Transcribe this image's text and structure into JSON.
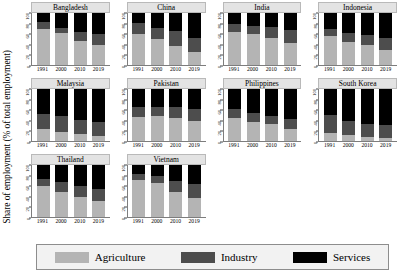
{
  "chart_data": {
    "type": "bar",
    "title": "",
    "subtype": "stacked-bar-small-multiples",
    "xlabel": "",
    "ylabel": "Share of employment (% of total employment)",
    "ylim": [
      0,
      100
    ],
    "yticks": [
      0,
      20,
      40,
      60,
      80,
      100
    ],
    "ytick_labels": [
      "0",
      "20",
      "40",
      "60",
      "80",
      "100"
    ],
    "categories": [
      "1991",
      "2000",
      "2010",
      "2019"
    ],
    "grid": false,
    "legend_position": "bottom",
    "series": [
      {
        "name": "Agriculture",
        "color": "#b4b4b4"
      },
      {
        "name": "Industry",
        "color": "#4d4d4d"
      },
      {
        "name": "Services",
        "color": "#000000"
      }
    ],
    "panels": [
      {
        "name": "Bangladesh",
        "values": {
          "Agriculture": [
            69,
            62,
            47,
            38
          ],
          "Industry": [
            13,
            10,
            17,
            21
          ],
          "Services": [
            18,
            28,
            36,
            41
          ]
        }
      },
      {
        "name": "China",
        "values": {
          "Agriculture": [
            60,
            50,
            37,
            25
          ],
          "Industry": [
            21,
            22,
            29,
            27
          ],
          "Services": [
            19,
            28,
            34,
            48
          ]
        }
      },
      {
        "name": "India",
        "values": {
          "Agriculture": [
            63,
            60,
            52,
            43
          ],
          "Industry": [
            15,
            16,
            22,
            25
          ],
          "Services": [
            22,
            24,
            26,
            32
          ]
        }
      },
      {
        "name": "Indonesia",
        "values": {
          "Agriculture": [
            55,
            45,
            38,
            29
          ],
          "Industry": [
            14,
            17,
            19,
            22
          ],
          "Services": [
            31,
            38,
            43,
            49
          ]
        }
      },
      {
        "name": "Malaysia",
        "values": {
          "Agriculture": [
            23,
            17,
            13,
            10
          ],
          "Industry": [
            29,
            32,
            28,
            27
          ],
          "Services": [
            48,
            51,
            59,
            63
          ]
        }
      },
      {
        "name": "Pakistan",
        "values": {
          "Agriculture": [
            47,
            48,
            44,
            38
          ],
          "Industry": [
            19,
            18,
            22,
            24
          ],
          "Services": [
            34,
            34,
            34,
            38
          ]
        }
      },
      {
        "name": "Philippines",
        "values": {
          "Agriculture": [
            45,
            37,
            33,
            23
          ],
          "Industry": [
            16,
            16,
            15,
            19
          ],
          "Services": [
            39,
            47,
            52,
            58
          ]
        }
      },
      {
        "name": "South Korea",
        "values": {
          "Agriculture": [
            16,
            11,
            7,
            5
          ],
          "Industry": [
            35,
            28,
            25,
            25
          ],
          "Services": [
            49,
            61,
            68,
            70
          ]
        }
      },
      {
        "name": "Thailand",
        "values": {
          "Agriculture": [
            60,
            49,
            39,
            31
          ],
          "Industry": [
            14,
            19,
            21,
            23
          ],
          "Services": [
            26,
            32,
            40,
            46
          ]
        }
      },
      {
        "name": "Vietnam",
        "values": {
          "Agriculture": [
            71,
            65,
            49,
            37
          ],
          "Industry": [
            11,
            13,
            21,
            27
          ],
          "Services": [
            18,
            22,
            30,
            36
          ]
        }
      }
    ]
  },
  "legend": {
    "items": [
      {
        "label": "Agriculture",
        "color": "#b4b4b4"
      },
      {
        "label": "Industry",
        "color": "#4d4d4d"
      },
      {
        "label": "Services",
        "color": "#000000"
      }
    ]
  }
}
